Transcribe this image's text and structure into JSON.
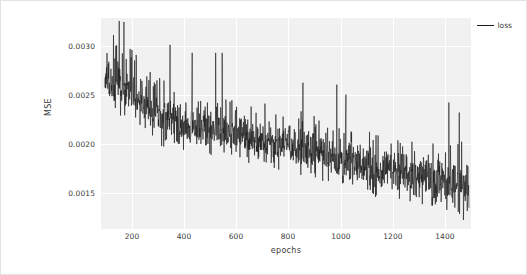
{
  "figure": {
    "background_color": "#ffffff",
    "border_color": "#e3e3e3",
    "plot_background_color": "#f1f1f1",
    "grid_color": "#ffffff",
    "line_color": "#1a1a1a"
  },
  "legend": {
    "position": "upper-right",
    "entries": [
      {
        "label": "loss",
        "color": "#1a1a1a"
      }
    ]
  },
  "axis": {
    "x_label": "epochs",
    "y_label": "MSE",
    "x_ticks": [
      "200",
      "400",
      "600",
      "800",
      "1000",
      "1200",
      "1400"
    ],
    "y_ticks": [
      "0.0015",
      "0.0020",
      "0.0025",
      "0.0030"
    ]
  },
  "chart_data": {
    "type": "line",
    "title": "",
    "xlabel": "epochs",
    "ylabel": "MSE",
    "xlim": [
      80,
      1500
    ],
    "ylim": [
      0.00113,
      0.00325
    ],
    "x_ticks": [
      200,
      400,
      600,
      800,
      1000,
      1200,
      1400
    ],
    "y_ticks": [
      0.0015,
      0.002,
      0.0025,
      0.003
    ],
    "grid": true,
    "legend_position": "upper right",
    "series": [
      {
        "name": "loss",
        "color": "#1a1a1a",
        "description": "Noisy per-epoch training MSE decreasing from about 0.0026 at epoch 100 to about 0.0015 at epoch 1490, with high-frequency oscillation of roughly +/-0.0004 and occasional upward spikes reaching 0.0032 early and 0.0026 late.",
        "trend_anchors": [
          {
            "x": 100,
            "y": 0.00262
          },
          {
            "x": 200,
            "y": 0.0025
          },
          {
            "x": 300,
            "y": 0.00228
          },
          {
            "x": 400,
            "y": 0.00218
          },
          {
            "x": 500,
            "y": 0.00213
          },
          {
            "x": 600,
            "y": 0.00208
          },
          {
            "x": 700,
            "y": 0.00203
          },
          {
            "x": 800,
            "y": 0.00198
          },
          {
            "x": 900,
            "y": 0.00191
          },
          {
            "x": 1000,
            "y": 0.00185
          },
          {
            "x": 1100,
            "y": 0.00177
          },
          {
            "x": 1200,
            "y": 0.00171
          },
          {
            "x": 1300,
            "y": 0.00166
          },
          {
            "x": 1400,
            "y": 0.0016
          },
          {
            "x": 1490,
            "y": 0.00152
          }
        ],
        "noise_envelope": [
          {
            "x": 100,
            "upper": 0.00305,
            "lower": 0.00232
          },
          {
            "x": 200,
            "upper": 0.00298,
            "lower": 0.00222
          },
          {
            "x": 300,
            "upper": 0.00268,
            "lower": 0.00197
          },
          {
            "x": 400,
            "upper": 0.00255,
            "lower": 0.0019
          },
          {
            "x": 500,
            "upper": 0.00252,
            "lower": 0.00186
          },
          {
            "x": 600,
            "upper": 0.00245,
            "lower": 0.00182
          },
          {
            "x": 700,
            "upper": 0.0024,
            "lower": 0.00176
          },
          {
            "x": 800,
            "upper": 0.00235,
            "lower": 0.0017
          },
          {
            "x": 900,
            "upper": 0.00228,
            "lower": 0.00162
          },
          {
            "x": 1000,
            "upper": 0.00222,
            "lower": 0.00155
          },
          {
            "x": 1100,
            "upper": 0.00212,
            "lower": 0.00145
          },
          {
            "x": 1200,
            "upper": 0.00205,
            "lower": 0.0014
          },
          {
            "x": 1300,
            "upper": 0.002,
            "lower": 0.00135
          },
          {
            "x": 1400,
            "upper": 0.002,
            "lower": 0.00128
          },
          {
            "x": 1490,
            "upper": 0.00205,
            "lower": 0.0012
          }
        ],
        "spikes": [
          {
            "x": 150,
            "y": 0.00322
          },
          {
            "x": 168,
            "y": 0.00321
          },
          {
            "x": 128,
            "y": 0.00308
          },
          {
            "x": 345,
            "y": 0.00298
          },
          {
            "x": 430,
            "y": 0.0029
          },
          {
            "x": 520,
            "y": 0.0029
          },
          {
            "x": 545,
            "y": 0.0029
          },
          {
            "x": 855,
            "y": 0.0026
          },
          {
            "x": 985,
            "y": 0.00258
          },
          {
            "x": 1020,
            "y": 0.00248
          },
          {
            "x": 1415,
            "y": 0.0024
          },
          {
            "x": 1455,
            "y": 0.0023
          }
        ],
        "n_points": 1400,
        "x_start": 95,
        "x_end": 1492
      }
    ]
  }
}
